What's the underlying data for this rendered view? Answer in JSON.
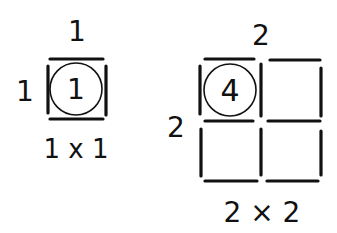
{
  "figures": [
    {
      "id": "square-1x1",
      "top_label": "1",
      "side_label": "1",
      "center_label": "1",
      "caption": "1 x 1"
    },
    {
      "id": "square-2x2",
      "top_label": "2",
      "side_label": "2",
      "center_label": "4",
      "caption": "2 × 2"
    }
  ],
  "colors": {
    "ink": "#111111",
    "background": "#ffffff"
  }
}
